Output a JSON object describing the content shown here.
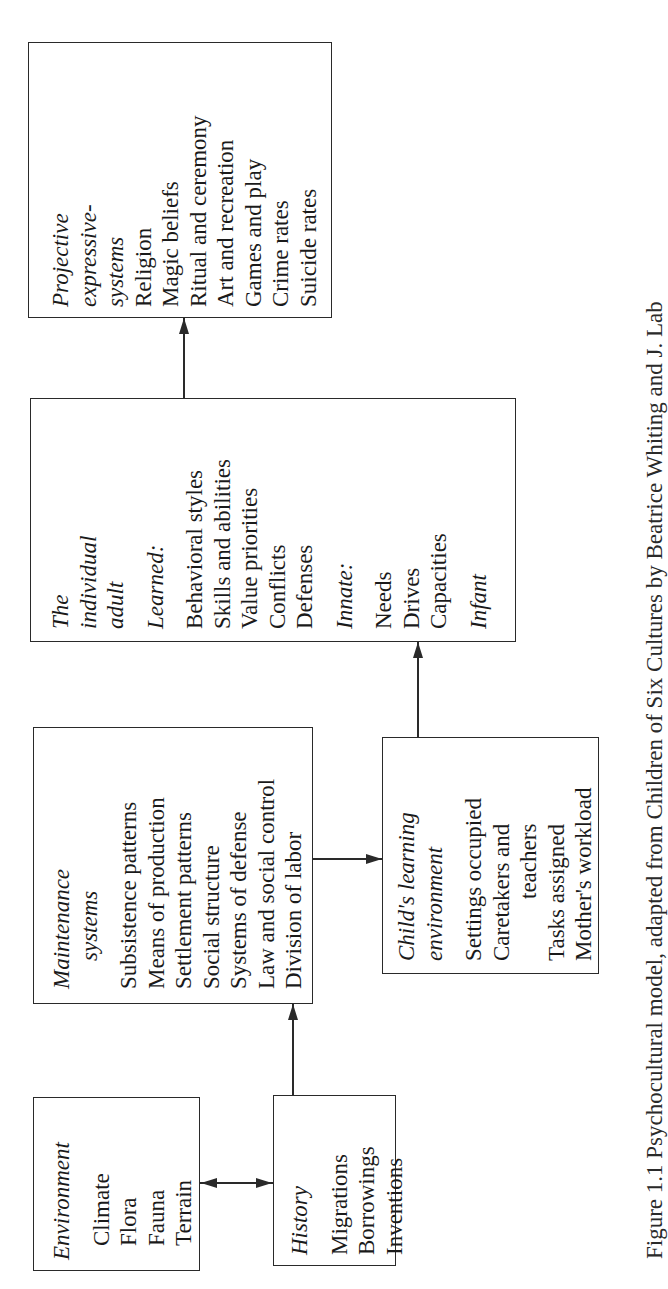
{
  "diagram": {
    "orientation": "rotated 90 degrees counter-clockwise",
    "boxes": {
      "environment": {
        "title": "Environment",
        "items": [
          "Climate",
          "Flora",
          "Fauna",
          "Terrain"
        ]
      },
      "history": {
        "title": "History",
        "items": [
          "Migrations",
          "Borrowings",
          "Inventions"
        ]
      },
      "maintenance": {
        "title_lines": [
          "Maintenance",
          "systems"
        ],
        "items": [
          "Subsistence patterns",
          "Means of production",
          "Settlement patterns",
          "Social structure",
          "Systems of defense",
          "Law and social control",
          "Division of labor"
        ]
      },
      "childs_learning": {
        "title_lines": [
          "Child's learning",
          "environment"
        ],
        "items": [
          "Settings occupied",
          "Caretakers and",
          "teachers",
          "Tasks assigned",
          "Mother's workload"
        ]
      },
      "individual_adult": {
        "title_lines": [
          "The",
          "individual",
          "adult"
        ],
        "learned_label": "Learned:",
        "learned_items": [
          "Behavioral styles",
          "Skills and abilities",
          "Value priorities",
          "Conflicts",
          "Defenses"
        ],
        "innate_label": "Innate:",
        "innate_items": [
          "Needs",
          "Drives",
          "Capacities"
        ],
        "infant_label": "Infant"
      },
      "projective": {
        "title_lines": [
          "Projective",
          "expressive-",
          "systems"
        ],
        "items": [
          "Religion",
          "Magic beliefs",
          "Ritual and ceremony",
          "Art and recreation",
          "Games and play",
          "Crime rates",
          "Suicide rates"
        ]
      }
    },
    "connections": [
      {
        "from": "environment",
        "to": "history",
        "type": "bidirectional"
      },
      {
        "from": "history",
        "to": "maintenance",
        "type": "arrow"
      },
      {
        "from": "maintenance",
        "to": "childs_learning",
        "type": "arrow"
      },
      {
        "from": "childs_learning",
        "to": "individual_adult",
        "type": "arrow"
      },
      {
        "from": "individual_adult",
        "to": "projective",
        "type": "arrow"
      }
    ],
    "caption": "Figure 1.1 Psychocultural model, adapted from Children of Six Cultures by Beatrice Whiting and J. Lab"
  },
  "colors": {
    "ink": "#2a2a2a",
    "background": "#ffffff"
  }
}
